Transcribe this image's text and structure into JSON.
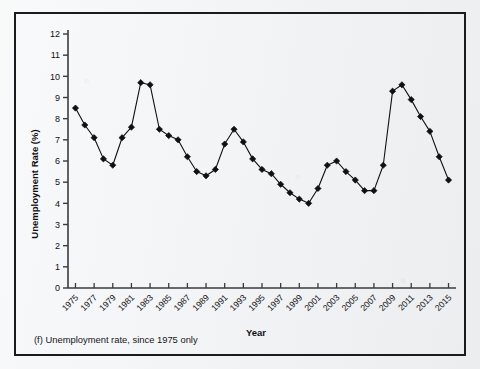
{
  "caption": "(f) Unemployment rate, since 1975 only",
  "colors": {
    "page_background": "#f2f3f5",
    "frame": "#1b1b1f",
    "axis": "#3a3a40",
    "series": "#101014",
    "marker": "#101014",
    "text": "#101014"
  },
  "chart_data": {
    "type": "line",
    "title": "",
    "subtitle": "",
    "xlabel": "Year",
    "ylabel": "Unemployment Rate (%)",
    "xlim": [
      1974.2,
      2015.8
    ],
    "ylim": [
      0,
      12
    ],
    "ytick_step": 1,
    "xtick_step": 2,
    "grid": false,
    "legend": "none",
    "marker": "diamond",
    "yticks": [
      0,
      1,
      2,
      3,
      4,
      5,
      6,
      7,
      8,
      9,
      10,
      11,
      12
    ],
    "ytick_labels": [
      "0",
      "1",
      "2",
      "3",
      "4",
      "5",
      "6",
      "7",
      "8",
      "9",
      "10",
      "11",
      "12"
    ],
    "xticks": [
      1975,
      1977,
      1979,
      1981,
      1983,
      1985,
      1987,
      1989,
      1991,
      1993,
      1995,
      1997,
      1999,
      2001,
      2003,
      2005,
      2007,
      2009,
      2011,
      2013,
      2015
    ],
    "xtick_labels": [
      "1975",
      "1977",
      "1979",
      "1981",
      "1983",
      "1985",
      "1987",
      "1989",
      "1991",
      "1993",
      "1995",
      "1997",
      "1999",
      "2001",
      "2003",
      "2005",
      "2007",
      "2009",
      "2011",
      "2013",
      "2015"
    ],
    "x": [
      1975,
      1976,
      1977,
      1978,
      1979,
      1980,
      1981,
      1982,
      1983,
      1984,
      1985,
      1986,
      1987,
      1988,
      1989,
      1990,
      1991,
      1992,
      1993,
      1994,
      1995,
      1996,
      1997,
      1998,
      1999,
      2000,
      2001,
      2002,
      2003,
      2004,
      2005,
      2006,
      2007,
      2008,
      2009,
      2010,
      2011,
      2012,
      2013,
      2014,
      2015
    ],
    "series": [
      {
        "name": "Unemployment Rate (%)",
        "values": [
          8.5,
          7.7,
          7.1,
          6.1,
          5.8,
          7.1,
          7.6,
          9.7,
          9.6,
          7.5,
          7.2,
          7.0,
          6.2,
          5.5,
          5.3,
          5.6,
          6.8,
          7.5,
          6.9,
          6.1,
          5.6,
          5.4,
          4.9,
          4.5,
          4.2,
          4.0,
          4.7,
          5.8,
          6.0,
          5.5,
          5.1,
          4.6,
          4.6,
          5.8,
          9.3,
          9.6,
          8.9,
          8.1,
          7.4,
          6.2,
          5.1
        ]
      }
    ]
  }
}
